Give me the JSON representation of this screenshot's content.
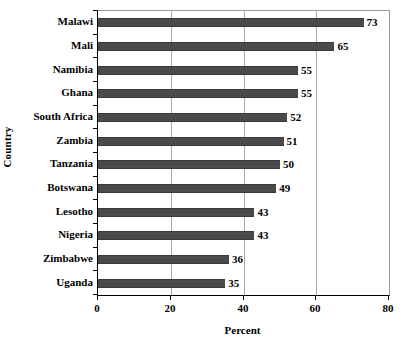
{
  "chart_data": {
    "type": "bar",
    "orientation": "horizontal",
    "title": "",
    "xlabel": "Percent",
    "ylabel": "Country",
    "categories": [
      "Malawi",
      "Mali",
      "Namibia",
      "Ghana",
      "South Africa",
      "Zambia",
      "Tanzania",
      "Botswana",
      "Lesotho",
      "Nigeria",
      "Zimbabwe",
      "Uganda"
    ],
    "values": [
      73,
      65,
      55,
      55,
      52,
      51,
      50,
      49,
      43,
      43,
      36,
      35
    ],
    "xlim": [
      0,
      80
    ],
    "xticks": [
      0,
      20,
      40,
      60,
      80
    ],
    "xtick_labels": [
      "0",
      "20",
      "40",
      "60",
      "80"
    ],
    "grid": "vertical-only",
    "legend": "none",
    "bar_color": "#4a4a4a",
    "gridline_color": "#a8a8a8",
    "axis_color": "#000000",
    "background_color": "#ffffff",
    "data_labels_shown": true
  }
}
